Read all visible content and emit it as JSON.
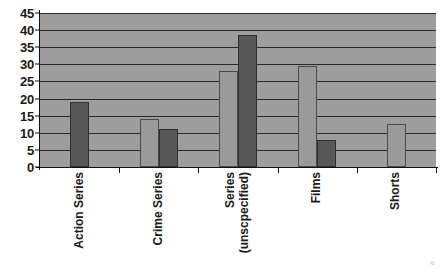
{
  "chart_data": {
    "type": "bar",
    "title": "",
    "xlabel": "",
    "ylabel": "",
    "ylim": [
      0,
      45
    ],
    "ytick_step": 5,
    "yticks": [
      45,
      40,
      35,
      30,
      25,
      20,
      15,
      10,
      5,
      0
    ],
    "grid": true,
    "legend": "none",
    "categories": [
      "Action Series",
      "Series (unscpecified)",
      "Crime Series",
      "Films",
      "Shorts"
    ],
    "category_labels": [
      {
        "line1": "Action Series",
        "line2": ""
      },
      {
        "line1": "Crime Series",
        "line2": ""
      },
      {
        "line1": "Series",
        "line2": "(unscpecified)"
      },
      {
        "line1": "Films",
        "line2": ""
      },
      {
        "line1": "Shorts",
        "line2": ""
      }
    ],
    "series": [
      {
        "name": "Series 1",
        "color": "#9a9a9a",
        "values": [
          null,
          14,
          28,
          29.5,
          12.5
        ]
      },
      {
        "name": "Series 2",
        "color": "#585858",
        "values": [
          19,
          11,
          38.5,
          8,
          null
        ]
      }
    ]
  },
  "style": {
    "plot_background": "#9d9d9d",
    "gridline_color": "#2a2a2a",
    "axis_color": "#111111",
    "text_color": "#1a1a1a",
    "page_background": "#ffffff"
  },
  "artifact": {
    "mark": "≈"
  }
}
